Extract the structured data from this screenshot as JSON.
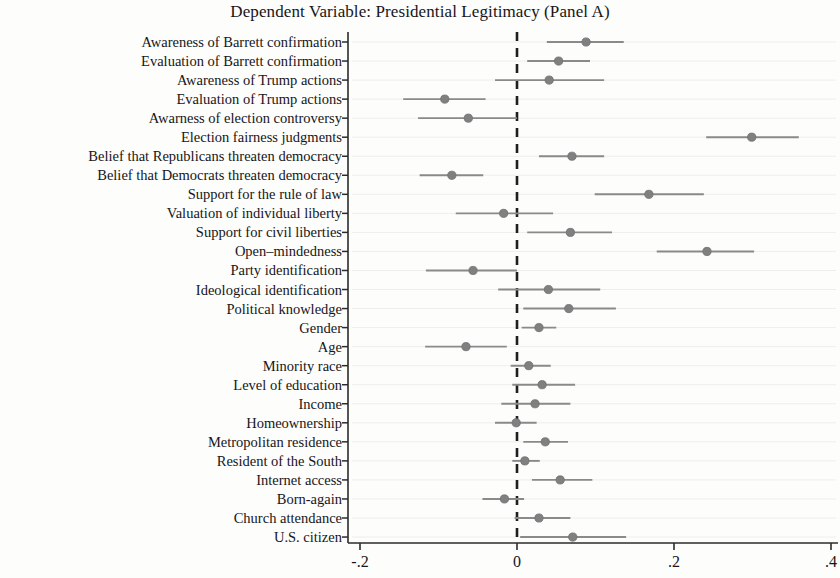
{
  "chart_data": {
    "type": "scatter",
    "title": "Dependent Variable: Presidential Legitimacy (Panel A)",
    "xlabel": "",
    "ylabel": "",
    "xlim": [
      -0.23,
      0.42
    ],
    "grid": false,
    "legend": "none",
    "reference_line": {
      "x": 0,
      "style": "dashed"
    },
    "xticks": [
      -0.2,
      0,
      0.2,
      0.4
    ],
    "xtick_labels": [
      "-.2",
      "0",
      ".2",
      ".4"
    ],
    "marker_color": "#808080",
    "line_color": "#8a8a8a",
    "categories": [
      "Awareness of Barrett confirmation",
      "Evaluation of Barrett confirmation",
      "Awareness of Trump actions",
      "Evaluation of Trump actions",
      "Awarness of election controversy",
      "Election fairness judgments",
      "Belief that Republicans threaten democracy",
      "Belief that Democrats threaten democracy",
      "Support for the rule of law",
      "Valuation of individual liberty",
      "Support for civil liberties",
      "Open–mindedness",
      "Party identification",
      "Ideological identification",
      "Political knowledge",
      "Gender",
      "Age",
      "Minority race",
      "Level of education",
      "Income",
      "Homeownership",
      "Metropolitan residence",
      "Resident of the South",
      "Internet access",
      "Born-again",
      "Church attendance",
      "U.S. citizen"
    ],
    "estimates": [
      0.088,
      0.053,
      0.041,
      -0.092,
      -0.062,
      0.299,
      0.07,
      -0.083,
      0.168,
      -0.017,
      0.068,
      0.242,
      -0.056,
      0.04,
      0.066,
      0.028,
      -0.065,
      0.015,
      0.032,
      0.023,
      -0.001,
      0.036,
      0.01,
      0.055,
      -0.016,
      0.028,
      0.071
    ],
    "ci_low": [
      0.038,
      0.013,
      -0.028,
      -0.145,
      -0.126,
      0.241,
      0.028,
      -0.124,
      0.099,
      -0.078,
      0.013,
      0.178,
      -0.116,
      -0.024,
      0.008,
      0.006,
      -0.117,
      -0.008,
      -0.006,
      -0.02,
      -0.028,
      0.008,
      -0.006,
      0.019,
      -0.044,
      -0.003,
      0.004
    ],
    "ci_high": [
      0.136,
      0.093,
      0.111,
      -0.04,
      0.0,
      0.359,
      0.111,
      -0.043,
      0.238,
      0.046,
      0.121,
      0.302,
      0.0,
      0.106,
      0.126,
      0.05,
      -0.013,
      0.043,
      0.074,
      0.068,
      0.025,
      0.065,
      0.029,
      0.096,
      0.009,
      0.068,
      0.139
    ]
  }
}
